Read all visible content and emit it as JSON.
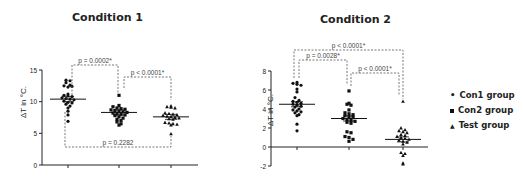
{
  "chart_data": [
    {
      "type": "scatter",
      "title": "Condition 1",
      "xlabel": "",
      "ylabel": "ΔT in °C.",
      "ylim": [
        0,
        15
      ],
      "yticks": [
        0,
        5,
        10,
        15
      ],
      "categories": [
        "Con1 group",
        "Con2 group",
        "Test group"
      ],
      "series": [
        {
          "name": "Con1 group",
          "marker": "circle",
          "mean": 10.4,
          "values": [
            13.4,
            13.3,
            13.0,
            12.6,
            12.5,
            12.3,
            12.4,
            11.2,
            11.0,
            10.9,
            10.8,
            10.6,
            10.5,
            10.4,
            10.3,
            10.1,
            9.9,
            9.8,
            9.6,
            9.3,
            9.0,
            8.5,
            7.9,
            6.9
          ]
        },
        {
          "name": "Con2 group",
          "marker": "square",
          "mean": 8.3,
          "values": [
            11.0,
            9.4,
            9.2,
            9.0,
            8.9,
            8.8,
            8.7,
            8.6,
            8.5,
            8.4,
            8.3,
            8.2,
            8.1,
            8.0,
            7.9,
            7.8,
            7.6,
            7.4,
            7.2,
            7.0,
            6.8,
            6.5,
            6.3
          ]
        },
        {
          "name": "Test group",
          "marker": "triangle",
          "mean": 7.6,
          "values": [
            9.3,
            9.2,
            9.1,
            9.0,
            8.2,
            8.1,
            8.0,
            7.9,
            7.8,
            7.7,
            7.6,
            7.5,
            7.4,
            7.3,
            7.2,
            6.7,
            6.6,
            6.5,
            6.4,
            6.3,
            4.9
          ]
        }
      ],
      "annotations": [
        {
          "text": "p = 0.0002*",
          "between": [
            "Con1 group",
            "Con2 group"
          ]
        },
        {
          "text": "p < 0.0001*",
          "between": [
            "Con2 group",
            "Test group"
          ]
        },
        {
          "text": "p = 0.2282",
          "between": [
            "Con1 group",
            "Test group"
          ],
          "position": "below"
        }
      ]
    },
    {
      "type": "scatter",
      "title": "Condition 2",
      "xlabel": "",
      "ylabel": "ΔT in °C.",
      "ylim": [
        -2,
        8
      ],
      "yticks": [
        -2,
        0,
        2,
        4,
        6,
        8
      ],
      "categories": [
        "Con1 group",
        "Con2 group",
        "Test group"
      ],
      "series": [
        {
          "name": "Con1 group",
          "marker": "circle",
          "mean": 4.5,
          "values": [
            6.8,
            6.7,
            6.6,
            6.5,
            6.1,
            5.8,
            5.2,
            4.9,
            4.8,
            4.7,
            4.6,
            4.5,
            4.4,
            4.3,
            4.2,
            4.0,
            3.9,
            3.8,
            3.7,
            3.6,
            3.4,
            3.3,
            2.4,
            1.7
          ]
        },
        {
          "name": "Con2 group",
          "marker": "square",
          "mean": 3.0,
          "values": [
            5.9,
            4.6,
            4.5,
            4.4,
            3.9,
            3.6,
            3.5,
            3.4,
            3.3,
            3.2,
            3.1,
            3.0,
            2.9,
            2.8,
            2.7,
            2.6,
            2.5,
            1.6,
            1.5,
            1.1,
            1.0,
            0.8,
            0.6
          ]
        },
        {
          "name": "Test group",
          "marker": "triangle",
          "mean": 0.8,
          "values": [
            4.8,
            2.0,
            1.8,
            1.7,
            1.6,
            1.5,
            1.3,
            1.2,
            1.1,
            1.0,
            0.9,
            0.8,
            0.7,
            0.6,
            0.5,
            0.3,
            -0.6,
            -0.7,
            -0.9,
            -1.7,
            -1.8
          ]
        }
      ],
      "annotations": [
        {
          "text": "p < 0.0001*",
          "between": [
            "Con1 group",
            "Test group"
          ]
        },
        {
          "text": "p = 0.0028*",
          "between": [
            "Con1 group",
            "Con2 group"
          ]
        },
        {
          "text": "p < 0.0001*",
          "between": [
            "Con2 group",
            "Test group"
          ]
        }
      ],
      "legend": {
        "position": "right",
        "entries": [
          "Con1 group",
          "Con2 group",
          "Test group"
        ]
      }
    }
  ],
  "titles": {
    "left": "Condition 1",
    "right": "Condition 2"
  },
  "axes": {
    "ylabel": "ΔT in °C."
  },
  "legend": [
    {
      "label": "Con1 group",
      "marker": "circle"
    },
    {
      "label": "Con2 group",
      "marker": "square"
    },
    {
      "label": "Test group",
      "marker": "triangle"
    }
  ]
}
